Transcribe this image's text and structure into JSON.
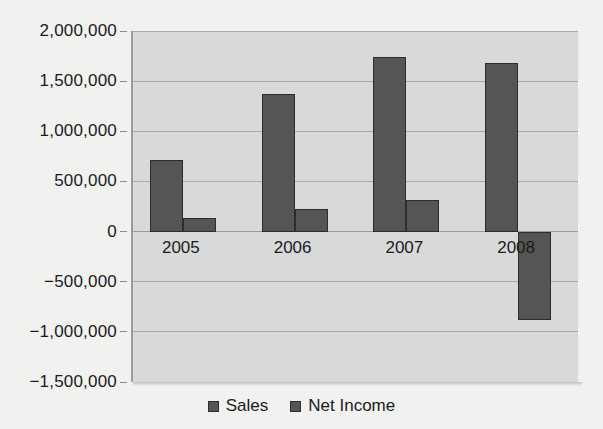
{
  "chart_data": {
    "type": "bar",
    "title": "",
    "subtitle": "",
    "xlabel": "",
    "ylabel": "",
    "categories": [
      "2005",
      "2006",
      "2007",
      "2008"
    ],
    "series": [
      {
        "name": "Sales",
        "values": [
          710000,
          1370000,
          1745000,
          1680000
        ],
        "color": "#555555"
      },
      {
        "name": "Net Income",
        "values": [
          140000,
          225000,
          310000,
          -880000
        ],
        "color": "#555555"
      }
    ],
    "ylim": [
      -1500000,
      2000000
    ],
    "y_ticks": [
      2000000,
      1500000,
      1000000,
      500000,
      0,
      -500000,
      -1000000,
      -1500000
    ],
    "y_tick_labels": [
      "2,000,000",
      "1,500,000",
      "1,000,000",
      "500,000",
      "0",
      "−500,000",
      "−1,000,000",
      "−1,500,000"
    ],
    "grid": true,
    "legend_position": "bottom",
    "plot_background": "#d9d9d9",
    "figure_background": "#f1f1f0",
    "axis_color": "#9a9a9a",
    "gridline_color": "#a9a9a9",
    "text_color": "#1b1b1b"
  },
  "legend": {
    "items": [
      {
        "label": "Sales",
        "swatch_name": "legend-swatch-sales"
      },
      {
        "label": "Net Income",
        "swatch_name": "legend-swatch-net-income"
      }
    ]
  }
}
